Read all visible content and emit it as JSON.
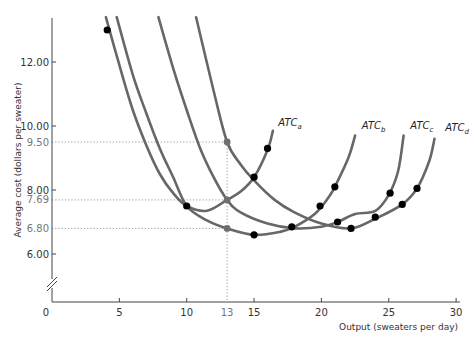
{
  "chart_data": {
    "type": "line",
    "title": "",
    "xlabel": "Output (sweaters per day)",
    "ylabel": "Average cost (dollars per sweater)",
    "xlim": [
      0,
      30
    ],
    "ylim_visible": [
      5.0,
      13.5
    ],
    "y_axis_break": true,
    "grid": false,
    "x_ticks": [
      {
        "value": 0,
        "label": "0"
      },
      {
        "value": 5,
        "label": "5"
      },
      {
        "value": 10,
        "label": "10"
      },
      {
        "value": 13,
        "label": "13",
        "highlight": true
      },
      {
        "value": 15,
        "label": "15"
      },
      {
        "value": 20,
        "label": "20"
      },
      {
        "value": 25,
        "label": "25"
      },
      {
        "value": 30,
        "label": "30"
      }
    ],
    "y_ticks": [
      {
        "value": 12.0,
        "label": "12.00"
      },
      {
        "value": 10.0,
        "label": "10.00"
      },
      {
        "value": 9.5,
        "label": "9.50",
        "highlight": true
      },
      {
        "value": 8.0,
        "label": "8.00"
      },
      {
        "value": 7.69,
        "label": "7.69",
        "highlight": true
      },
      {
        "value": 6.8,
        "label": "6.80",
        "highlight": true
      },
      {
        "value": 6.0,
        "label": "6.00"
      }
    ],
    "series": [
      {
        "name": "ATC_a",
        "label_main": "ATC",
        "label_sub": "a",
        "points": [
          [
            4.0,
            13.4
          ],
          [
            5,
            11.9
          ],
          [
            6,
            10.5
          ],
          [
            7,
            9.4
          ],
          [
            8,
            8.5
          ],
          [
            9,
            7.9
          ],
          [
            10,
            7.5
          ],
          [
            11.5,
            7.35
          ],
          [
            13,
            7.69
          ],
          [
            14,
            7.95
          ],
          [
            15,
            8.4
          ],
          [
            16,
            9.25
          ],
          [
            16.4,
            9.85
          ]
        ],
        "markers": [
          [
            4.1,
            13.0
          ],
          [
            10,
            7.5
          ],
          [
            15,
            8.4
          ],
          [
            16,
            9.3
          ]
        ],
        "label_at": [
          16.8,
          10.0
        ]
      },
      {
        "name": "ATC_b",
        "label_main": "ATC",
        "label_sub": "b",
        "points": [
          [
            4.8,
            13.4
          ],
          [
            6,
            11.6
          ],
          [
            7,
            10.4
          ],
          [
            8,
            9.3
          ],
          [
            9,
            8.4
          ],
          [
            10,
            7.5
          ],
          [
            11.5,
            7.05
          ],
          [
            13,
            6.8
          ],
          [
            15,
            6.6
          ],
          [
            17,
            6.7
          ],
          [
            18,
            6.85
          ],
          [
            19.5,
            7.25
          ],
          [
            20.5,
            7.75
          ],
          [
            21,
            8.1
          ],
          [
            22,
            9.0
          ],
          [
            22.5,
            9.7
          ]
        ],
        "markers": [
          [
            15,
            6.6
          ],
          [
            17.8,
            6.85
          ],
          [
            19.9,
            7.5
          ],
          [
            21,
            8.1
          ]
        ],
        "label_at": [
          23.0,
          9.9
        ]
      },
      {
        "name": "ATC_c",
        "label_main": "ATC",
        "label_sub": "c",
        "points": [
          [
            7.9,
            13.4
          ],
          [
            9,
            11.8
          ],
          [
            10,
            10.5
          ],
          [
            11,
            9.3
          ],
          [
            12,
            8.4
          ],
          [
            13,
            7.69
          ],
          [
            14,
            7.3
          ],
          [
            16,
            6.95
          ],
          [
            18,
            6.8
          ],
          [
            20,
            6.85
          ],
          [
            21.2,
            7.0
          ],
          [
            22.5,
            7.25
          ],
          [
            24,
            7.35
          ],
          [
            25,
            7.85
          ],
          [
            25.7,
            8.6
          ],
          [
            26.1,
            9.7
          ]
        ],
        "markers": [
          [
            21.2,
            7.0
          ],
          [
            25.1,
            7.9
          ]
        ],
        "label_at": [
          26.6,
          9.9
        ]
      },
      {
        "name": "ATC_d",
        "label_main": "ATC",
        "label_sub": "d",
        "points": [
          [
            10.7,
            13.4
          ],
          [
            12,
            11.1
          ],
          [
            13,
            9.5
          ],
          [
            14,
            8.8
          ],
          [
            15,
            8.3
          ],
          [
            16.5,
            7.7
          ],
          [
            18,
            7.3
          ],
          [
            20,
            6.95
          ],
          [
            22.2,
            6.8
          ],
          [
            24,
            7.1
          ],
          [
            26,
            7.55
          ],
          [
            27.1,
            8.05
          ],
          [
            28,
            8.9
          ],
          [
            28.4,
            9.6
          ]
        ],
        "markers": [
          [
            22.2,
            6.8
          ],
          [
            24,
            7.15
          ],
          [
            26,
            7.55
          ],
          [
            27.1,
            8.05
          ]
        ],
        "label_at": [
          29.2,
          9.85
        ]
      }
    ],
    "reference_points": [
      {
        "x": 13,
        "y": 9.5
      },
      {
        "x": 13,
        "y": 7.69
      },
      {
        "x": 13,
        "y": 6.8
      }
    ],
    "guide_lines": {
      "horizontal": [
        9.5,
        7.69,
        6.8
      ],
      "vertical": [
        13
      ]
    },
    "colors": {
      "curve": "#676767",
      "marker": "#000000",
      "reference_marker": "#6f6f6f",
      "axis": "#444444",
      "guide": "#999999"
    }
  }
}
